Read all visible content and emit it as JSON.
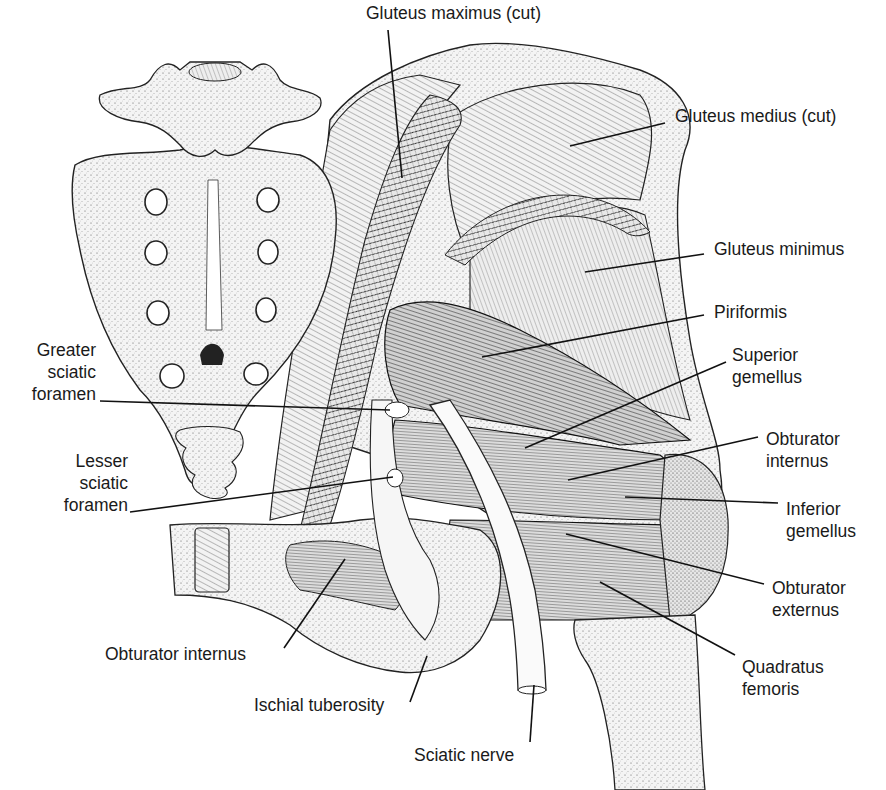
{
  "figure": {
    "width": 886,
    "height": 790,
    "ink_color": "#1a1a1a",
    "background": "#ffffff"
  },
  "labels": [
    {
      "id": "gluteus-maximus",
      "lines": [
        "Gluteus maximus (cut)"
      ],
      "x": 366,
      "y": 2,
      "align": "left",
      "leader": [
        [
          388,
          30
        ],
        [
          402,
          178
        ]
      ]
    },
    {
      "id": "gluteus-medius",
      "lines": [
        "Gluteus medius (cut)"
      ],
      "x": 675,
      "y": 105,
      "align": "left",
      "leader": [
        [
          665,
          123
        ],
        [
          570,
          146
        ]
      ]
    },
    {
      "id": "gluteus-minimus",
      "lines": [
        "Gluteus minimus"
      ],
      "x": 714,
      "y": 238,
      "align": "left",
      "leader": [
        [
          704,
          254
        ],
        [
          585,
          272
        ]
      ]
    },
    {
      "id": "piriformis",
      "lines": [
        "Piriformis"
      ],
      "x": 714,
      "y": 301,
      "align": "left",
      "leader": [
        [
          704,
          315
        ],
        [
          482,
          357
        ]
      ]
    },
    {
      "id": "superior-gemellus",
      "lines": [
        "Superior",
        "gemellus"
      ],
      "x": 732,
      "y": 344,
      "align": "left",
      "leader": [
        [
          726,
          362
        ],
        [
          525,
          448
        ]
      ]
    },
    {
      "id": "obturator-internus-right",
      "lines": [
        "Obturator",
        "internus"
      ],
      "x": 766,
      "y": 428,
      "align": "left",
      "leader": [
        [
          758,
          437
        ],
        [
          568,
          480
        ]
      ]
    },
    {
      "id": "inferior-gemellus",
      "lines": [
        "Inferior",
        "gemellus"
      ],
      "x": 786,
      "y": 498,
      "align": "left",
      "leader": [
        [
          778,
          503
        ],
        [
          625,
          497
        ]
      ]
    },
    {
      "id": "obturator-externus",
      "lines": [
        "Obturator",
        "externus"
      ],
      "x": 772,
      "y": 577,
      "align": "left",
      "leader": [
        [
          764,
          584
        ],
        [
          566,
          534
        ]
      ]
    },
    {
      "id": "quadratus-femoris",
      "lines": [
        "Quadratus",
        "femoris"
      ],
      "x": 742,
      "y": 656,
      "align": "left",
      "leader": [
        [
          735,
          655
        ],
        [
          600,
          582
        ]
      ]
    },
    {
      "id": "greater-sciatic-foramen",
      "lines": [
        "Greater",
        "sciatic",
        "foramen"
      ],
      "x": 18,
      "y": 339,
      "align": "right",
      "leader": [
        [
          100,
          401
        ],
        [
          390,
          410
        ]
      ]
    },
    {
      "id": "lesser-sciatic-foramen",
      "lines": [
        "Lesser",
        "sciatic",
        "foramen"
      ],
      "x": 50,
      "y": 450,
      "align": "right",
      "leader": [
        [
          130,
          512
        ],
        [
          393,
          477
        ]
      ]
    },
    {
      "id": "obturator-internus-left",
      "lines": [
        "Obturator internus"
      ],
      "x": 105,
      "y": 643,
      "align": "left",
      "leader": [
        [
          284,
          648
        ],
        [
          345,
          559
        ]
      ]
    },
    {
      "id": "ischial-tuberosity",
      "lines": [
        "Ischial tuberosity"
      ],
      "x": 254,
      "y": 694,
      "align": "left",
      "leader": [
        [
          410,
          702
        ],
        [
          427,
          656
        ]
      ]
    },
    {
      "id": "sciatic-nerve",
      "lines": [
        "Sciatic nerve"
      ],
      "x": 414,
      "y": 744,
      "align": "left",
      "leader": [
        [
          530,
          742
        ],
        [
          534,
          685
        ]
      ]
    }
  ]
}
